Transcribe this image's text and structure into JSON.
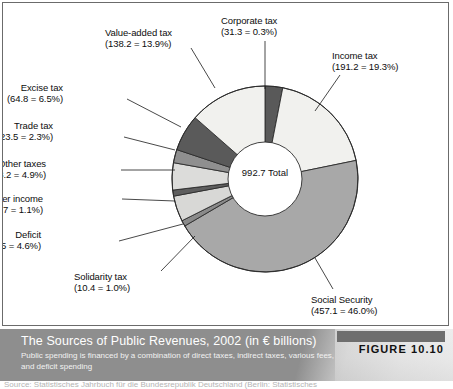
{
  "figure": {
    "number_label": "FIGURE 10.10",
    "caption_title": "The Sources of Public Revenues, 2002 (in € billions)",
    "caption_subtitle": "Public spending is financed by a combination of direct taxes, indirect taxes, various fees, and deficit spending",
    "source_note": "Source: Statistisches Jahrbuch für die Bundesrepublik Deutschland (Berlin: Statistisches"
  },
  "center": {
    "total_value": "992.7",
    "total_word": "Total"
  },
  "chart_data": {
    "type": "pie",
    "title": "The Sources of Public Revenues, 2002 (in € billions)",
    "units": "€ billions",
    "total": 992.7,
    "total_label": "992.7 Total",
    "legend_position": "callout-labels",
    "grid": false,
    "start_angle_deg": -90,
    "direction": "clockwise",
    "donut_hole_ratio": 0.39,
    "slices": [
      {
        "name": "Corporate tax",
        "value": 31.3,
        "percent_label": "0.3%",
        "percent_of_total": 3.15,
        "label_line1": "Corporate tax",
        "label_line2": "(31.3 = 0.3%)",
        "color": "#595959"
      },
      {
        "name": "Income tax",
        "value": 191.2,
        "percent_label": "19.3%",
        "percent_of_total": 19.3,
        "label_line1": "Income tax",
        "label_line2": "(191.2 = 19.3%)",
        "color": "#f1f1ee"
      },
      {
        "name": "Social Security",
        "value": 457.1,
        "percent_label": "46.0%",
        "percent_of_total": 46.0,
        "label_line1": "Social Security",
        "label_line2": "(457.1 = 46.0%)",
        "color": "#a8a8a8"
      },
      {
        "name": "Solidarity tax",
        "value": 10.4,
        "percent_label": "1.0%",
        "percent_of_total": 1.0,
        "label_line1": "Solidarity tax",
        "label_line2": "(10.4 = 1.0%)",
        "color": "#8a8a8a"
      },
      {
        "name": "Deficit",
        "value": 45.5,
        "percent_label": "4.6%",
        "percent_of_total": 4.6,
        "label_line1": "Deficit",
        "label_line2": "(45.5 = 4.6%)",
        "color": "#d8d8d6"
      },
      {
        "name": "Other income",
        "value": 10.7,
        "percent_label": "1.1%",
        "percent_of_total": 1.1,
        "label_line1": "Other income",
        "label_line2": "(10.7 = 1.1%)",
        "color": "#5e5e5e"
      },
      {
        "name": "Other taxes",
        "value": 48.2,
        "percent_label": "4.9%",
        "percent_of_total": 4.9,
        "label_line1": "Other taxes",
        "label_line2": "(48.2 = 4.9%)",
        "color": "#dcdcda"
      },
      {
        "name": "Trade tax",
        "value": 23.5,
        "percent_label": "2.3%",
        "percent_of_total": 2.3,
        "label_line1": "Trade tax",
        "label_line2": "(23.5 = 2.3%)",
        "color": "#8f8f8f"
      },
      {
        "name": "Excise tax",
        "value": 64.8,
        "percent_label": "6.5%",
        "percent_of_total": 6.5,
        "label_line1": "Excise tax",
        "label_line2": "(64.8 = 6.5%)",
        "color": "#5a5a5a"
      },
      {
        "name": "Value-added tax",
        "value": 138.2,
        "percent_label": "13.9%",
        "percent_of_total": 13.9,
        "label_line1": "Value-added tax",
        "label_line2": "(138.2 = 13.9%)",
        "color": "#f1f1ee"
      }
    ]
  },
  "label_positions": [
    {
      "key": "Corporate tax",
      "x": 218,
      "y": 12,
      "align": "left",
      "leader": [
        [
          262,
          38
        ],
        [
          262,
          86
        ]
      ]
    },
    {
      "key": "Income tax",
      "x": 329,
      "y": 47,
      "align": "left",
      "leader": [
        [
          337,
          72
        ],
        [
          312,
          108
        ]
      ]
    },
    {
      "key": "Social Security",
      "x": 308,
      "y": 291,
      "align": "left",
      "leader": [
        [
          330,
          286
        ],
        [
          312,
          255
        ]
      ]
    },
    {
      "key": "Solidarity tax",
      "x": 71,
      "y": 268,
      "align": "left",
      "leader": [
        [
          158,
          268
        ],
        [
          192,
          233
        ]
      ]
    },
    {
      "key": "Deficit",
      "x": 40,
      "y": 226,
      "align": "right",
      "leader": [
        [
          116,
          238
        ],
        [
          180,
          221
        ]
      ]
    },
    {
      "key": "Other income",
      "x": 42,
      "y": 190,
      "align": "right",
      "leader": [
        [
          119,
          196
        ],
        [
          172,
          198
        ]
      ]
    },
    {
      "key": "Other taxes",
      "x": 45,
      "y": 155,
      "align": "right",
      "leader": [
        [
          118,
          167
        ],
        [
          172,
          167
        ]
      ]
    },
    {
      "key": "Trade tax",
      "x": 52,
      "y": 117,
      "align": "right",
      "leader": [
        [
          121,
          134
        ],
        [
          172,
          147
        ]
      ]
    },
    {
      "key": "Excise tax",
      "x": 62,
      "y": 79,
      "align": "right",
      "leader": [
        [
          124,
          96
        ],
        [
          178,
          124
        ]
      ]
    },
    {
      "key": "Value-added tax",
      "x": 102,
      "y": 24,
      "align": "left",
      "leader": [
        [
          188,
          45
        ],
        [
          212,
          85
        ]
      ]
    }
  ],
  "geometry": {
    "cx": 262,
    "cy": 176,
    "r": 93,
    "hole_r": 37
  }
}
